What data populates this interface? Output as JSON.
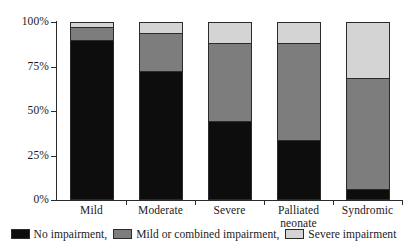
{
  "chart_data": {
    "type": "bar",
    "subtype": "stacked-100-percent",
    "title": "",
    "xlabel": "",
    "ylabel": "",
    "ylim": [
      0,
      100
    ],
    "ytick_labels": [
      "0%",
      "25%",
      "50%",
      "75%",
      "100%"
    ],
    "ytick_values": [
      0,
      25,
      50,
      75,
      100
    ],
    "grid": false,
    "legend_position": "bottom",
    "categories": [
      "Mild",
      "Moderate",
      "Severe",
      "Palliated neonate",
      "Syndromic"
    ],
    "category_lines": [
      [
        "Mild"
      ],
      [
        "Moderate"
      ],
      [
        "Severe"
      ],
      [
        "Palliated",
        "neonate"
      ],
      [
        "Syndromic"
      ]
    ],
    "series": [
      {
        "name": "No impairment,",
        "color": "#0d0d0d",
        "values": [
          90,
          72,
          44,
          33,
          5
        ]
      },
      {
        "name": "Mild or combined impairment,",
        "color": "#7d7d7d",
        "values": [
          7,
          22,
          44,
          55,
          63
        ]
      },
      {
        "name": "Severe impairment",
        "color": "#d4d4d4",
        "values": [
          3,
          6,
          12,
          12,
          32
        ]
      }
    ]
  },
  "legend": {
    "items": [
      {
        "label": "No impairment,",
        "color": "#0d0d0d"
      },
      {
        "label": "Mild or combined impairment,",
        "color": "#7d7d7d"
      },
      {
        "label": "Severe impairment",
        "color": "#d4d4d4"
      }
    ]
  },
  "axes": {
    "y": {
      "ticks": [
        {
          "label": "100%",
          "value": 100
        },
        {
          "label": "75%",
          "value": 75
        },
        {
          "label": "50%",
          "value": 50
        },
        {
          "label": "25%",
          "value": 25
        },
        {
          "label": "0%",
          "value": 0
        }
      ]
    }
  },
  "colors": {
    "axis": "#2b2b2b",
    "text": "#1a1a1a",
    "background": "#ffffff",
    "no_impairment": "#0d0d0d",
    "mild_or_combined": "#7d7d7d",
    "severe": "#d4d4d4"
  }
}
